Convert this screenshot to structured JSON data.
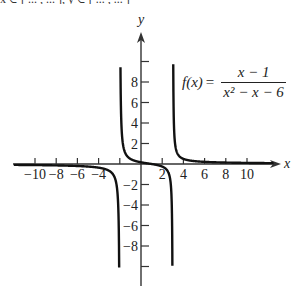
{
  "figure": {
    "top_strip_text": "x ∈ [ ... , ... ],  y ∈ [ ... , ... ]",
    "function_label": {
      "lhs": "f(x)",
      "equals": "=",
      "numerator": "x − 1",
      "denominator": "x² − x − 6"
    },
    "colors": {
      "axis": "#333333",
      "curve": "#111111",
      "text": "#222222",
      "background": "#ffffff"
    }
  },
  "chart_data": {
    "type": "line",
    "function": "(x-1)/(x^2-x-6)",
    "xlabel": "x",
    "ylabel": "y",
    "xlim": [
      -12,
      12.5
    ],
    "ylim": [
      -11.5,
      12.5
    ],
    "x_ticks": [
      -10,
      -8,
      -6,
      -4,
      -2,
      2,
      4,
      6,
      8,
      10
    ],
    "x_tick_labels": [
      "−10",
      "−8",
      "−6",
      "−4",
      "2",
      "4",
      "6",
      "8",
      "10"
    ],
    "y_ticks": [
      -10,
      -8,
      -6,
      -4,
      -2,
      2,
      4,
      6,
      8,
      10
    ],
    "y_tick_labels": [
      "8",
      "6",
      "4",
      "2",
      "−2",
      "−4",
      "−6",
      "−8"
    ],
    "vertical_asymptotes": [
      -2,
      3
    ],
    "horizontal_asymptote": 0,
    "grid": false,
    "legend": null,
    "series": [
      {
        "name": "left branch (x < −2)",
        "x": [
          -12,
          -10,
          -8,
          -6,
          -4,
          -3,
          -2.5,
          -2.2,
          -2.1
        ],
        "y": [
          -0.09,
          -0.11,
          -0.15,
          -0.23,
          -0.36,
          -0.67,
          -1.27,
          -3.09,
          -5.95
        ]
      },
      {
        "name": "middle branch (−2 < x < 3)",
        "x": [
          -1.85,
          -1.5,
          -1,
          0,
          1,
          2,
          2.5,
          2.8,
          2.9
        ],
        "y": [
          10.1,
          3.57,
          1.0,
          0.17,
          0.0,
          -0.25,
          -0.67,
          -1.69,
          -3.78
        ]
      },
      {
        "name": "right branch (x > 3)",
        "x": [
          3.15,
          3.5,
          4,
          6,
          8,
          10,
          12
        ],
        "y": [
          9.4,
          2.3,
          1.0,
          0.42,
          0.28,
          0.21,
          0.16
        ]
      }
    ]
  }
}
